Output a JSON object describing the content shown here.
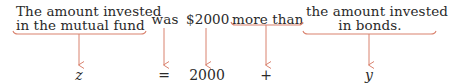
{
  "colors": {
    "text": "#2a2a2a",
    "arrow": "#d9826e"
  },
  "phrases": [
    {
      "id": "mutual-fund",
      "line1": "The amount invested",
      "line2": "in the mutual fund"
    },
    {
      "id": "was",
      "line1": "was"
    },
    {
      "id": "amount",
      "line1": "$2000"
    },
    {
      "id": "more-than",
      "line1": "more than"
    },
    {
      "id": "bonds",
      "line1": "the amount invested",
      "line2": "in bonds."
    }
  ],
  "equation": [
    {
      "id": "z",
      "symbol": "z"
    },
    {
      "id": "equals",
      "symbol": "="
    },
    {
      "id": "constant",
      "symbol": "2000"
    },
    {
      "id": "plus",
      "symbol": "+"
    },
    {
      "id": "y",
      "symbol": "y"
    }
  ]
}
